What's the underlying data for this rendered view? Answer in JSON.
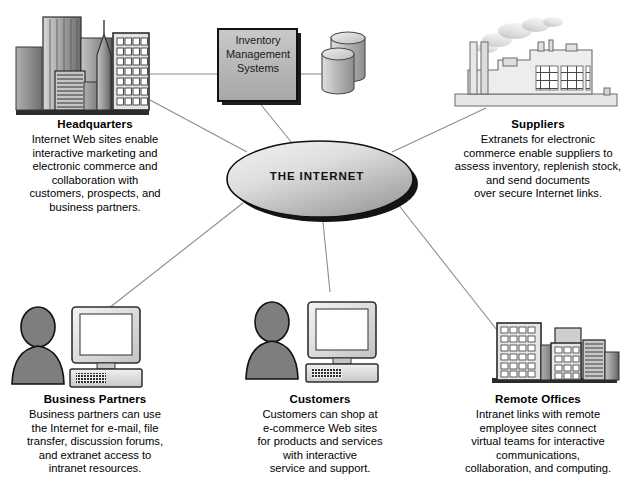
{
  "diagram": {
    "center_node": {
      "label": "THE INTERNET"
    },
    "inventory_box": {
      "line1": "Inventory",
      "line2": "Management",
      "line3": "Systems"
    },
    "nodes": [
      {
        "id": "headquarters",
        "icon": "city-skyline-icon",
        "title": "Headquarters",
        "desc_lines": [
          "Internet Web sites enable",
          "interactive marketing and",
          "electronic commerce and",
          "collaboration with",
          "customers, prospects, and",
          "business partners."
        ]
      },
      {
        "id": "suppliers",
        "icon": "factory-icon",
        "title": "Suppliers",
        "desc_lines": [
          "Extranets for electronic",
          "commerce enable suppliers to",
          "assess inventory, replenish stock,",
          "and send documents",
          "over secure Internet links."
        ]
      },
      {
        "id": "business-partners",
        "icon": "person-computer-icon",
        "title": "Business Partners",
        "desc_lines": [
          "Business partners can use",
          "the Internet for e-mail, file",
          "transfer, discussion forums,",
          "and extranet access to",
          "intranet resources."
        ]
      },
      {
        "id": "customers",
        "icon": "person-computer-icon",
        "title": "Customers",
        "desc_lines": [
          "Customers can shop at",
          "e-commerce Web sites",
          "for products and services",
          "with interactive",
          "service and support."
        ]
      },
      {
        "id": "remote-offices",
        "icon": "office-buildings-icon",
        "title": "Remote Offices",
        "desc_lines": [
          "Intranet links with remote",
          "employee sites connect",
          "virtual teams for interactive",
          "communications,",
          "collaboration, and computing."
        ]
      }
    ],
    "colors": {
      "background": "#ffffff",
      "line": "#8d8d8d",
      "ellipse_light": "#e8e8e8",
      "ellipse_dark": "#a9a9a9",
      "box_fill": "#b5b5b5",
      "shadow": "#1a1a1a",
      "icon_gray": "#7d7d7d",
      "icon_light": "#d2d2d2",
      "text": "#000000"
    }
  }
}
